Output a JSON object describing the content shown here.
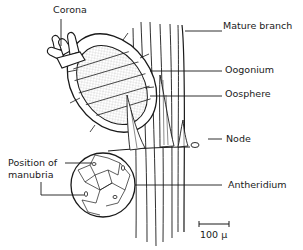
{
  "diagram": {
    "labels": {
      "corona": "Corona",
      "mature_branch": "Mature branch",
      "oogonium": "Oogonium",
      "oosphere": "Oosphere",
      "node": "Node",
      "position_of_manubria_line1": "Position of",
      "position_of_manubria_line2": "manubria",
      "antheridium": "Antheridium"
    },
    "scale_bar": {
      "label": "100 μ"
    },
    "colors": {
      "ink": "#1a1a1a",
      "background": "#ffffff"
    }
  }
}
